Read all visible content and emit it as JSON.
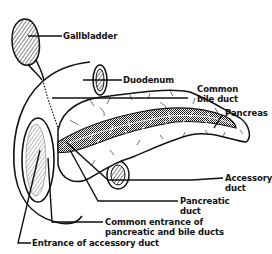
{
  "diagram": {
    "colors": {
      "ink": "#111111",
      "background": "#ffffff"
    },
    "labels": {
      "gallbladder": "Gallbladder",
      "duodenum": "Duodenum",
      "common_bile_duct_1": "Common",
      "common_bile_duct_2": "bile duct",
      "pancreas": "Pancreas",
      "accessory_duct_1": "Accessory",
      "accessory_duct_2": "duct",
      "pancreatic_duct_1": "Pancreatic",
      "pancreatic_duct_2": "duct",
      "common_entrance_1": "Common entrance of",
      "common_entrance_2": "pancreatic and bile ducts",
      "entrance_accessory": "Entrance of accessory duct"
    }
  }
}
